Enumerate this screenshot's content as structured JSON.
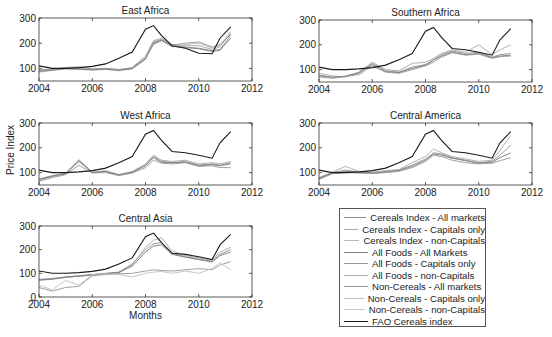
{
  "figure": {
    "ylabel": "Price Index",
    "xlabel": "Months"
  },
  "legend": {
    "items": [
      {
        "label": "Cereals Index - All markets",
        "color": "#8c8c8c"
      },
      {
        "label": "Cereals Index - Capitals only",
        "color": "#a8a8a8"
      },
      {
        "label": "Cereals Index - non-Capitals",
        "color": "#b8b8b8"
      },
      {
        "label": "All Foods - All Markets",
        "color": "#7a7a7a"
      },
      {
        "label": "All Foods - Capitals only",
        "color": "#9a9a9a"
      },
      {
        "label": "All Foods - non-Capitals",
        "color": "#b0b0b0"
      },
      {
        "label": "Non-Cereals - All markets",
        "color": "#959595"
      },
      {
        "label": "Non-Cereals - Capitals only",
        "color": "#c0c0c0"
      },
      {
        "label": "Non-Cereals - non-Capitals",
        "color": "#cacaca"
      },
      {
        "label": "FAO Cereals index",
        "color": "#1a1a1a"
      }
    ]
  },
  "chart_data": [
    {
      "type": "line",
      "title": "East Africa",
      "xlabel": "",
      "ylabel": "Price Index",
      "xlim": [
        2004,
        2012
      ],
      "ylim": [
        50,
        300
      ],
      "xticks": [
        2004,
        2006,
        2008,
        2010,
        2012
      ],
      "yticks": [
        100,
        200,
        300
      ],
      "grid": false,
      "x": [
        2004,
        2004.5,
        2005,
        2005.5,
        2006,
        2006.5,
        2007,
        2007.5,
        2008,
        2008.3,
        2008.6,
        2009,
        2009.5,
        2010,
        2010.5,
        2010.8,
        2011.2
      ],
      "series": [
        {
          "name": "FAO Cereals index",
          "values": [
            110,
            100,
            100,
            103,
            108,
            118,
            140,
            165,
            255,
            270,
            230,
            190,
            180,
            160,
            158,
            220,
            265
          ]
        },
        {
          "name": "Cereals Index - All markets",
          "values": [
            90,
            95,
            100,
            98,
            95,
            98,
            92,
            100,
            140,
            205,
            215,
            190,
            185,
            180,
            170,
            175,
            230
          ]
        },
        {
          "name": "Cereals Index - Capitals only",
          "values": [
            95,
            98,
            102,
            100,
            97,
            100,
            94,
            104,
            150,
            210,
            220,
            195,
            190,
            190,
            175,
            185,
            240
          ]
        },
        {
          "name": "Cereals Index - non-Capitals",
          "values": [
            85,
            92,
            98,
            96,
            93,
            96,
            90,
            98,
            135,
            200,
            210,
            185,
            195,
            200,
            180,
            190,
            245
          ]
        },
        {
          "name": "All Foods - All Markets",
          "values": [
            88,
            93,
            99,
            97,
            95,
            97,
            93,
            99,
            138,
            200,
            212,
            188,
            182,
            178,
            168,
            172,
            220
          ]
        },
        {
          "name": "Non-Cereals - All markets",
          "values": [
            92,
            96,
            104,
            106,
            98,
            100,
            96,
            102,
            142,
            195,
            210,
            192,
            200,
            205,
            185,
            195,
            235
          ]
        }
      ]
    },
    {
      "type": "line",
      "title": "Southern Africa",
      "xlabel": "",
      "ylabel": "",
      "xlim": [
        2004,
        2012
      ],
      "ylim": [
        50,
        300
      ],
      "xticks": [
        2004,
        2006,
        2008,
        2010,
        2012
      ],
      "yticks": [
        100,
        200,
        300
      ],
      "grid": false,
      "x": [
        2004,
        2004.5,
        2005,
        2005.5,
        2006,
        2006.5,
        2007,
        2007.5,
        2008,
        2008.3,
        2008.6,
        2009,
        2009.5,
        2010,
        2010.5,
        2010.8,
        2011.2
      ],
      "series": [
        {
          "name": "FAO Cereals index",
          "values": [
            110,
            100,
            100,
            103,
            108,
            118,
            140,
            165,
            255,
            270,
            230,
            185,
            180,
            170,
            158,
            220,
            265
          ]
        },
        {
          "name": "Cereals Index - All markets",
          "values": [
            75,
            70,
            72,
            85,
            125,
            95,
            90,
            110,
            120,
            140,
            160,
            175,
            165,
            170,
            150,
            160,
            165
          ]
        },
        {
          "name": "Cereals Index - Capitals only",
          "values": [
            85,
            75,
            70,
            90,
            130,
            100,
            95,
            125,
            130,
            145,
            165,
            180,
            170,
            200,
            160,
            180,
            200
          ]
        },
        {
          "name": "All Foods - All Markets",
          "values": [
            78,
            68,
            74,
            88,
            120,
            92,
            88,
            105,
            118,
            138,
            155,
            170,
            160,
            165,
            148,
            155,
            158
          ]
        },
        {
          "name": "Non-Cereals - All markets",
          "values": [
            70,
            65,
            72,
            80,
            115,
            90,
            85,
            100,
            115,
            130,
            150,
            168,
            158,
            162,
            145,
            152,
            155
          ]
        }
      ]
    },
    {
      "type": "line",
      "title": "West Africa",
      "xlabel": "",
      "ylabel": "Price Index",
      "xlim": [
        2004,
        2012
      ],
      "ylim": [
        50,
        300
      ],
      "xticks": [
        2004,
        2006,
        2008,
        2010,
        2012
      ],
      "yticks": [
        100,
        200,
        300
      ],
      "grid": false,
      "x": [
        2004,
        2004.5,
        2005,
        2005.5,
        2006,
        2006.5,
        2007,
        2007.5,
        2008,
        2008.3,
        2008.6,
        2009,
        2009.5,
        2010,
        2010.5,
        2010.8,
        2011.2
      ],
      "series": [
        {
          "name": "FAO Cereals index",
          "values": [
            110,
            100,
            100,
            103,
            108,
            118,
            140,
            165,
            255,
            270,
            230,
            185,
            180,
            170,
            158,
            220,
            265
          ]
        },
        {
          "name": "Cereals Index - All markets",
          "values": [
            70,
            85,
            95,
            150,
            100,
            105,
            90,
            100,
            130,
            165,
            145,
            140,
            145,
            130,
            135,
            130,
            140
          ]
        },
        {
          "name": "Cereals Index - Capitals only",
          "values": [
            75,
            88,
            98,
            152,
            102,
            108,
            92,
            104,
            135,
            170,
            150,
            145,
            150,
            135,
            140,
            135,
            145
          ]
        },
        {
          "name": "All Foods - All Markets",
          "values": [
            72,
            86,
            96,
            145,
            101,
            104,
            91,
            102,
            128,
            160,
            142,
            140,
            142,
            128,
            132,
            128,
            135
          ]
        },
        {
          "name": "Non-Cereals - All markets",
          "values": [
            65,
            80,
            92,
            130,
            98,
            100,
            88,
            98,
            120,
            150,
            138,
            135,
            140,
            125,
            128,
            120,
            120
          ]
        }
      ]
    },
    {
      "type": "line",
      "title": "Central America",
      "xlabel": "",
      "ylabel": "",
      "xlim": [
        2004,
        2012
      ],
      "ylim": [
        50,
        300
      ],
      "xticks": [
        2004,
        2006,
        2008,
        2010,
        2012
      ],
      "yticks": [
        100,
        200,
        300
      ],
      "grid": false,
      "x": [
        2004,
        2004.5,
        2005,
        2005.5,
        2006,
        2006.5,
        2007,
        2007.5,
        2008,
        2008.3,
        2008.6,
        2009,
        2009.5,
        2010,
        2010.5,
        2010.8,
        2011.2
      ],
      "series": [
        {
          "name": "FAO Cereals index",
          "values": [
            110,
            100,
            100,
            103,
            108,
            118,
            140,
            165,
            255,
            270,
            230,
            185,
            180,
            170,
            158,
            220,
            265
          ]
        },
        {
          "name": "Cereals Index - All markets",
          "values": [
            75,
            100,
            110,
            102,
            100,
            105,
            110,
            130,
            155,
            180,
            175,
            160,
            150,
            140,
            145,
            170,
            210
          ]
        },
        {
          "name": "Cereals Index - Capitals only",
          "values": [
            80,
            102,
            125,
            105,
            102,
            108,
            112,
            140,
            165,
            195,
            180,
            165,
            155,
            145,
            150,
            190,
            250
          ]
        },
        {
          "name": "All Foods - All Markets",
          "values": [
            78,
            98,
            105,
            100,
            98,
            102,
            108,
            125,
            150,
            175,
            170,
            158,
            148,
            138,
            142,
            160,
            180
          ]
        },
        {
          "name": "Non-Cereals - All markets",
          "values": [
            72,
            95,
            100,
            98,
            96,
            100,
            105,
            120,
            145,
            170,
            165,
            150,
            140,
            135,
            138,
            148,
            160
          ]
        }
      ]
    },
    {
      "type": "line",
      "title": "Central Asia",
      "xlabel": "Months",
      "ylabel": "",
      "xlim": [
        2004,
        2012
      ],
      "ylim": [
        0,
        300
      ],
      "xticks": [
        2004,
        2006,
        2008,
        2010,
        2012
      ],
      "yticks": [
        0,
        100,
        200,
        300
      ],
      "grid": false,
      "x": [
        2004,
        2004.5,
        2005,
        2005.5,
        2006,
        2006.5,
        2007,
        2007.5,
        2008,
        2008.3,
        2008.6,
        2009,
        2009.5,
        2010,
        2010.5,
        2010.8,
        2011.2
      ],
      "series": [
        {
          "name": "FAO Cereals index",
          "values": [
            110,
            100,
            100,
            103,
            108,
            118,
            140,
            165,
            255,
            270,
            230,
            185,
            180,
            170,
            158,
            220,
            265
          ]
        },
        {
          "name": "Cereals Index - All markets",
          "values": [
            75,
            78,
            85,
            90,
            95,
            100,
            105,
            140,
            200,
            225,
            230,
            185,
            170,
            160,
            150,
            180,
            200
          ]
        },
        {
          "name": "Cereals Index - Capitals only",
          "values": [
            70,
            75,
            82,
            88,
            92,
            98,
            102,
            135,
            210,
            240,
            250,
            195,
            175,
            165,
            155,
            190,
            210
          ]
        },
        {
          "name": "All Foods - All Markets",
          "values": [
            72,
            76,
            84,
            88,
            94,
            99,
            104,
            130,
            190,
            215,
            220,
            180,
            168,
            158,
            148,
            175,
            190
          ]
        },
        {
          "name": "Non-Cereals - All markets",
          "values": [
            40,
            25,
            40,
            45,
            90,
            95,
            98,
            100,
            110,
            115,
            112,
            110,
            115,
            120,
            115,
            135,
            150
          ]
        },
        {
          "name": "Non-Cereals - Capitals only",
          "values": [
            50,
            30,
            70,
            50,
            95,
            98,
            95,
            85,
            100,
            105,
            108,
            100,
            110,
            100,
            120,
            145,
            115
          ]
        }
      ]
    }
  ]
}
